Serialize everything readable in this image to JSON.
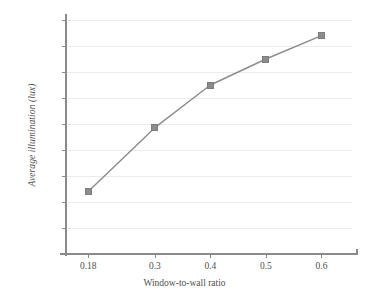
{
  "chart_data": {
    "type": "line",
    "title": "",
    "xlabel": "Window-to-wall ratio",
    "ylabel": "Average illumination (lux)",
    "x": [
      0.18,
      0.3,
      0.4,
      0.5,
      0.6
    ],
    "xtick_labels": [
      "0.18",
      "0.3",
      "0.4",
      "0.5",
      "0.6"
    ],
    "values": [
      120,
      243,
      325,
      375,
      420
    ],
    "ytick_labels": [
      "0",
      "50",
      "100",
      "150",
      "200",
      "250",
      "300",
      "350",
      "400",
      "450"
    ],
    "ytick_values": [
      0,
      50,
      100,
      150,
      200,
      250,
      300,
      350,
      400,
      450
    ],
    "ylim": [
      0,
      450
    ],
    "grid": "horizontal",
    "legend": "none",
    "series": [
      {
        "name": "Average illumination",
        "marker": "square",
        "values": [
          120,
          243,
          325,
          375,
          420
        ]
      }
    ],
    "colors": {
      "line": "#8c8c8c",
      "marker": "#8c8c8c",
      "gridline": "#ececec",
      "axis": "#8a8a8a",
      "text": "#4f4f4f",
      "background": "#ffffff"
    }
  }
}
